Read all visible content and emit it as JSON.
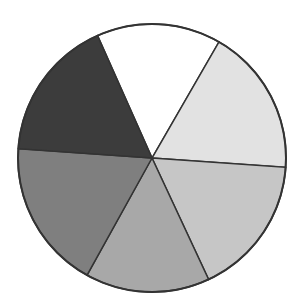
{
  "chart_data": {
    "type": "pie",
    "title": "",
    "labels": [],
    "legend": "none",
    "center": [
      152,
      158
    ],
    "radius": 134,
    "start_angle_deg": 336,
    "slices": [
      {
        "name": "white",
        "degrees": 54,
        "percent": 15.0,
        "color": "#ffffff"
      },
      {
        "name": "very-light-gray",
        "degrees": 64,
        "percent": 17.8,
        "color": "#e2e2e2"
      },
      {
        "name": "light-gray",
        "degrees": 61,
        "percent": 16.9,
        "color": "#c6c6c6"
      },
      {
        "name": "medium-gray",
        "degrees": 54,
        "percent": 15.0,
        "color": "#a8a8a8"
      },
      {
        "name": "dark-gray",
        "degrees": 65,
        "percent": 18.1,
        "color": "#7f7f7f"
      },
      {
        "name": "darkest-gray",
        "degrees": 62,
        "percent": 17.2,
        "color": "#3c3c3c"
      }
    ],
    "outline_color": "#333333"
  }
}
